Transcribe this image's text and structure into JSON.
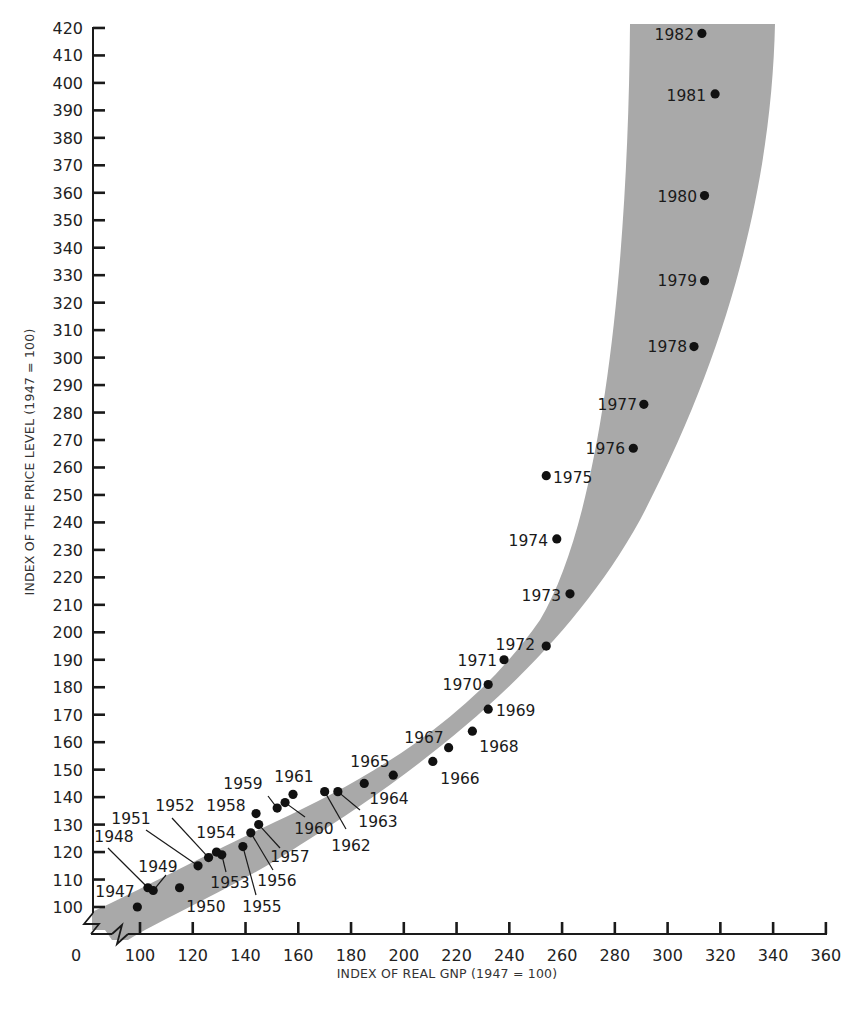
{
  "chart_data": {
    "type": "scatter",
    "title": "",
    "xlabel": "INDEX OF REAL GNP (1947 = 100)",
    "ylabel": "INDEX OF THE PRICE LEVEL (1947 = 100)",
    "xlim": [
      0,
      360
    ],
    "ylim": [
      0,
      420
    ],
    "x_ticks": [
      0,
      100,
      120,
      140,
      160,
      180,
      200,
      220,
      240,
      260,
      280,
      300,
      320,
      340,
      360
    ],
    "y_ticks": [
      100,
      110,
      120,
      130,
      140,
      150,
      160,
      170,
      180,
      190,
      200,
      210,
      220,
      230,
      240,
      250,
      260,
      270,
      280,
      290,
      300,
      310,
      320,
      330,
      340,
      350,
      360,
      370,
      380,
      390,
      400,
      410,
      420
    ],
    "axis_breaks": {
      "x": "between 0 and 100",
      "y": "between 0 and 100"
    },
    "grid": false,
    "legend": null,
    "band": {
      "description": "shaded gray band following the upward-curving trend of the points",
      "color": "#a9a9a9"
    },
    "point_color": "#111111",
    "points": [
      {
        "label": "1947",
        "x": 99,
        "y": 100
      },
      {
        "label": "1948",
        "x": 103,
        "y": 107
      },
      {
        "label": "1949",
        "x": 105,
        "y": 106
      },
      {
        "label": "1950",
        "x": 115,
        "y": 107
      },
      {
        "label": "1951",
        "x": 122,
        "y": 115
      },
      {
        "label": "1952",
        "x": 126,
        "y": 118
      },
      {
        "label": "1953",
        "x": 131,
        "y": 119
      },
      {
        "label": "1954",
        "x": 129,
        "y": 120
      },
      {
        "label": "1955",
        "x": 139,
        "y": 122
      },
      {
        "label": "1956",
        "x": 142,
        "y": 127
      },
      {
        "label": "1957",
        "x": 145,
        "y": 130
      },
      {
        "label": "1958",
        "x": 144,
        "y": 134
      },
      {
        "label": "1959",
        "x": 152,
        "y": 136
      },
      {
        "label": "1960",
        "x": 155,
        "y": 138
      },
      {
        "label": "1961",
        "x": 158,
        "y": 141
      },
      {
        "label": "1962",
        "x": 170,
        "y": 142
      },
      {
        "label": "1963",
        "x": 175,
        "y": 142
      },
      {
        "label": "1964",
        "x": 185,
        "y": 145
      },
      {
        "label": "1965",
        "x": 196,
        "y": 148
      },
      {
        "label": "1966",
        "x": 211,
        "y": 153
      },
      {
        "label": "1967",
        "x": 217,
        "y": 158
      },
      {
        "label": "1968",
        "x": 226,
        "y": 164
      },
      {
        "label": "1969",
        "x": 232,
        "y": 172
      },
      {
        "label": "1970",
        "x": 232,
        "y": 181
      },
      {
        "label": "1971",
        "x": 238,
        "y": 190
      },
      {
        "label": "1972",
        "x": 254,
        "y": 195
      },
      {
        "label": "1973",
        "x": 263,
        "y": 214
      },
      {
        "label": "1974",
        "x": 258,
        "y": 234
      },
      {
        "label": "1975",
        "x": 254,
        "y": 257
      },
      {
        "label": "1976",
        "x": 287,
        "y": 267
      },
      {
        "label": "1977",
        "x": 291,
        "y": 283
      },
      {
        "label": "1978",
        "x": 310,
        "y": 304
      },
      {
        "label": "1979",
        "x": 314,
        "y": 328
      },
      {
        "label": "1980",
        "x": 314,
        "y": 359
      },
      {
        "label": "1981",
        "x": 318,
        "y": 396
      },
      {
        "label": "1982",
        "x": 313,
        "y": 418
      }
    ]
  },
  "labels": {
    "x_axis": "INDEX OF REAL GNP (1947 = 100)",
    "y_axis": "INDEX OF THE PRICE LEVEL (1947 = 100)",
    "zero": "0"
  }
}
